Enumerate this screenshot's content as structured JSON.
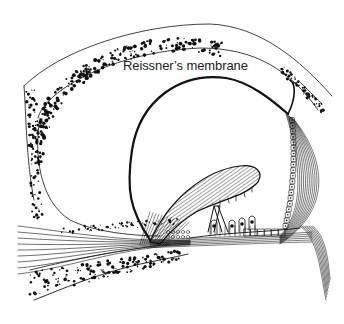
{
  "figure": {
    "labels": [
      {
        "id": "reissners-membrane",
        "text": "Reissner’s membrane"
      }
    ],
    "colors": {
      "ink": "#111111",
      "background": "#ffffff",
      "label": "#222222"
    }
  }
}
